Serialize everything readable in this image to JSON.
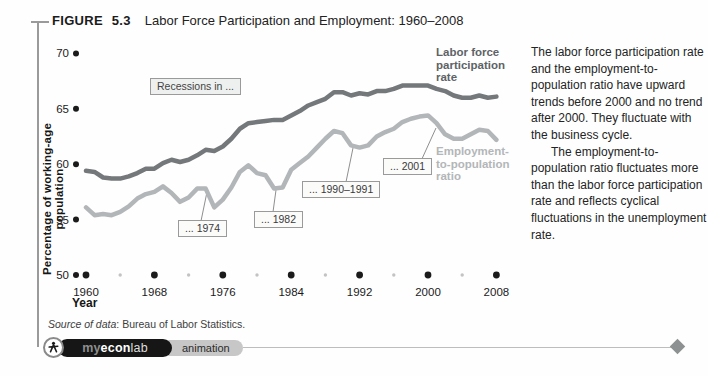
{
  "figure": {
    "label": "FIGURE 5.3",
    "title": "Labor Force Participation and Employment: 1960–2008"
  },
  "chart_data": {
    "type": "line",
    "title": "Labor Force Participation and Employment: 1960–2008",
    "xlabel": "Year",
    "ylabel": "Percentage of working-age population",
    "ylim": [
      50,
      70
    ],
    "y_ticks": [
      50,
      55,
      60,
      65,
      70
    ],
    "x_ticks": [
      1960,
      1968,
      1976,
      1984,
      1992,
      2000,
      2008
    ],
    "x_minor_ticks": [
      1964,
      1972,
      1980,
      1988,
      1996,
      2004
    ],
    "grid": false,
    "legend_position": "inline-right",
    "x": [
      1960,
      1961,
      1962,
      1963,
      1964,
      1965,
      1966,
      1967,
      1968,
      1969,
      1970,
      1971,
      1972,
      1973,
      1974,
      1975,
      1976,
      1977,
      1978,
      1979,
      1980,
      1981,
      1982,
      1983,
      1984,
      1985,
      1986,
      1987,
      1988,
      1989,
      1990,
      1991,
      1992,
      1993,
      1994,
      1995,
      1996,
      1997,
      1998,
      1999,
      2000,
      2001,
      2002,
      2003,
      2004,
      2005,
      2006,
      2007,
      2008
    ],
    "series": [
      {
        "name": "Labor force participation rate",
        "color": "#74787a",
        "values": [
          59.4,
          59.3,
          58.8,
          58.7,
          58.7,
          58.9,
          59.2,
          59.6,
          59.6,
          60.1,
          60.4,
          60.2,
          60.4,
          60.8,
          61.3,
          61.2,
          61.6,
          62.3,
          63.2,
          63.7,
          63.8,
          63.9,
          64.0,
          64.0,
          64.4,
          64.8,
          65.3,
          65.6,
          65.9,
          66.5,
          66.5,
          66.2,
          66.4,
          66.3,
          66.6,
          66.6,
          66.8,
          67.1,
          67.1,
          67.1,
          67.1,
          66.8,
          66.6,
          66.2,
          66.0,
          66.0,
          66.2,
          66.0,
          66.1
        ],
        "stroke_width": 4.5
      },
      {
        "name": "Employment-to-population ratio",
        "color": "#b3b6b8",
        "values": [
          56.1,
          55.4,
          55.5,
          55.4,
          55.7,
          56.2,
          56.9,
          57.3,
          57.5,
          58.0,
          57.4,
          56.6,
          57.0,
          57.8,
          57.8,
          56.1,
          56.8,
          57.9,
          59.3,
          59.9,
          59.2,
          59.0,
          57.8,
          57.9,
          59.5,
          60.1,
          60.7,
          61.5,
          62.3,
          63.0,
          62.8,
          61.7,
          61.5,
          61.7,
          62.5,
          62.9,
          63.2,
          63.8,
          64.1,
          64.3,
          64.4,
          63.7,
          62.7,
          62.3,
          62.3,
          62.7,
          63.1,
          63.0,
          62.2
        ],
        "stroke_width": 4.5
      }
    ]
  },
  "annotations": {
    "recessions": "Recessions in ...",
    "c1974": "... 1974",
    "c1982": "... 1982",
    "c1990": "... 1990–1991",
    "c2001": "... 2001",
    "lfpr_label": "Labor force\nparticipation\nrate",
    "epop_label": "Employment-\nto-population\nratio"
  },
  "axis": {
    "x_title": "Year",
    "y_title": "Percentage of working-age population"
  },
  "source": {
    "prefix": "Source of data",
    "rest": ": Bureau of Labor Statistics."
  },
  "caption": {
    "para1": "The labor force participation rate and the employment-to-population ratio have upward trends before 2000 and no trend after 2000. They fluctuate with the business cycle.",
    "para2": "The employment-to-population ratio fluctuates more than the labor force participation rate and reflects cyclical fluctuations in the unemployment rate."
  },
  "footer": {
    "brand_my": "my",
    "brand_econ": "econ",
    "brand_lab": "lab",
    "animation_label": "animation"
  },
  "colors": {
    "lfpr_line": "#74787a",
    "epop_line": "#b3b6b8",
    "tick_dot": "#1b1b1b",
    "minor_dot": "#c3c3c3",
    "rule": "#9a9a9a"
  }
}
